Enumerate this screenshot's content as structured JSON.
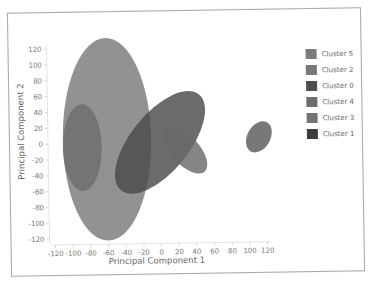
{
  "chart_data": {
    "type": "scatter",
    "subtype": "cluster-ellipses",
    "title": "",
    "xlabel": "Principal Component 1",
    "ylabel": "Principal Component 2",
    "xlim": [
      -120,
      120
    ],
    "ylim": [
      -120,
      120
    ],
    "xticks": [
      "-120",
      "-100",
      "-80",
      "-60",
      "-40",
      "-20",
      "0",
      "20",
      "40",
      "60",
      "80",
      "100",
      "120"
    ],
    "yticks": [
      "120",
      "100",
      "80",
      "60",
      "40",
      "20",
      "0",
      "-20",
      "-40",
      "-60",
      "-80",
      "-100",
      "-120"
    ],
    "grid": false,
    "legend_position": "right",
    "legend": [
      "Cluster 5",
      "Cluster 2",
      "Cluster 0",
      "Cluster 4",
      "Cluster 3",
      "Cluster 1"
    ],
    "series": [
      {
        "name": "Cluster 5",
        "center": [
          -60,
          5
        ],
        "rx": 50,
        "ry": 128,
        "angle": 0,
        "color": "#7a7a7a"
      },
      {
        "name": "Cluster 2",
        "center": [
          -88,
          -5
        ],
        "rx": 22,
        "ry": 55,
        "angle": 0,
        "color": "#6e6e6e"
      },
      {
        "name": "Cluster 0",
        "center": [
          0,
          0
        ],
        "rx": 33,
        "ry": 78,
        "angle": 40,
        "color": "#4a4a4a"
      },
      {
        "name": "Cluster 4",
        "center": [
          28,
          -10
        ],
        "rx": 16,
        "ry": 37,
        "angle": -42,
        "color": "#6a6a6a"
      },
      {
        "name": "Cluster 3",
        "center": [
          112,
          5
        ],
        "rx": 13,
        "ry": 21,
        "angle": 30,
        "color": "#5a5a5a"
      },
      {
        "name": "Cluster 1",
        "center": [
          112,
          5
        ],
        "rx": 13,
        "ry": 21,
        "angle": 30,
        "color": "#404040"
      }
    ]
  },
  "legend": {
    "items": [
      {
        "label": "Cluster 5",
        "color": "#7c7c7c"
      },
      {
        "label": "Cluster 2",
        "color": "#787878"
      },
      {
        "label": "Cluster 0",
        "color": "#4e4e4e"
      },
      {
        "label": "Cluster 4",
        "color": "#6e6e6e"
      },
      {
        "label": "Cluster 3",
        "color": "#747474"
      },
      {
        "label": "Cluster 1",
        "color": "#3e3e3e"
      }
    ]
  },
  "axes": {
    "x_title": "Principal Component 1",
    "y_title": "Principal Component 2"
  }
}
